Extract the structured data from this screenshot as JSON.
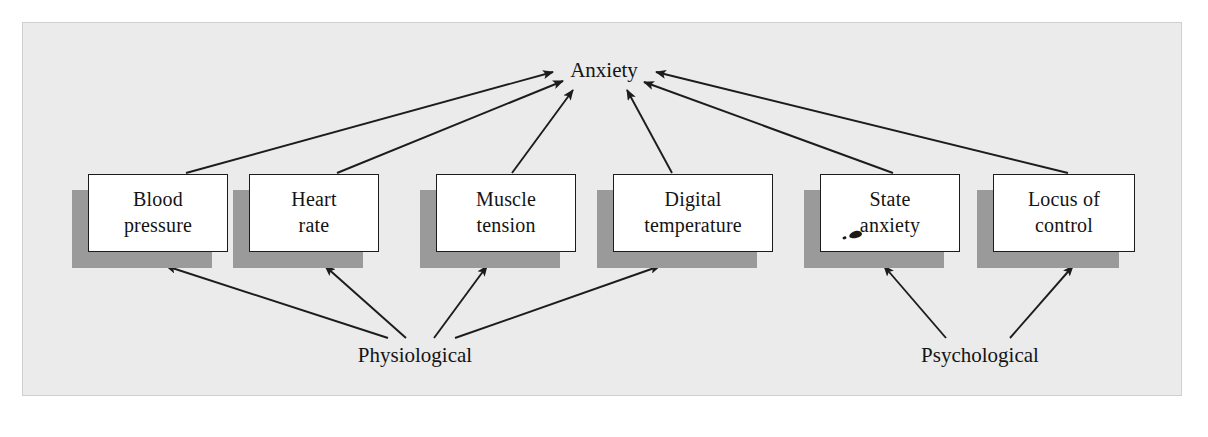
{
  "figure": {
    "title_node": "Anxiety",
    "group_labels": {
      "physiological": "Physiological",
      "psychological": "Psychological"
    },
    "background_color": "#ebebeb",
    "shadow_color": "#9a9a9a",
    "border_color": "#1c1c1c",
    "text_color": "#141414"
  },
  "nodes": [
    {
      "id": "blood-pressure",
      "line1": "Blood",
      "line2": "pressure",
      "group": "physiological"
    },
    {
      "id": "heart-rate",
      "line1": "Heart",
      "line2": "rate",
      "group": "physiological"
    },
    {
      "id": "muscle-tension",
      "line1": "Muscle",
      "line2": "tension",
      "group": "physiological"
    },
    {
      "id": "digital-temperature",
      "line1": "Digital",
      "line2": "temperature",
      "group": "physiological"
    },
    {
      "id": "state-anxiety",
      "line1": "State",
      "line2": "anxiety",
      "group": "psychological"
    },
    {
      "id": "locus-of-control",
      "line1": "Locus of",
      "line2": "control",
      "group": "psychological"
    }
  ],
  "edges_to_anxiety": [
    {
      "from": "blood-pressure",
      "to": "Anxiety"
    },
    {
      "from": "heart-rate",
      "to": "Anxiety"
    },
    {
      "from": "muscle-tension",
      "to": "Anxiety"
    },
    {
      "from": "digital-temperature",
      "to": "Anxiety"
    },
    {
      "from": "state-anxiety",
      "to": "Anxiety"
    },
    {
      "from": "locus-of-control",
      "to": "Anxiety"
    }
  ],
  "edges_from_groups": [
    {
      "from": "Physiological",
      "to": "blood-pressure"
    },
    {
      "from": "Physiological",
      "to": "heart-rate"
    },
    {
      "from": "Physiological",
      "to": "muscle-tension"
    },
    {
      "from": "Physiological",
      "to": "digital-temperature"
    },
    {
      "from": "Psychological",
      "to": "state-anxiety"
    },
    {
      "from": "Psychological",
      "to": "locus-of-control"
    }
  ]
}
